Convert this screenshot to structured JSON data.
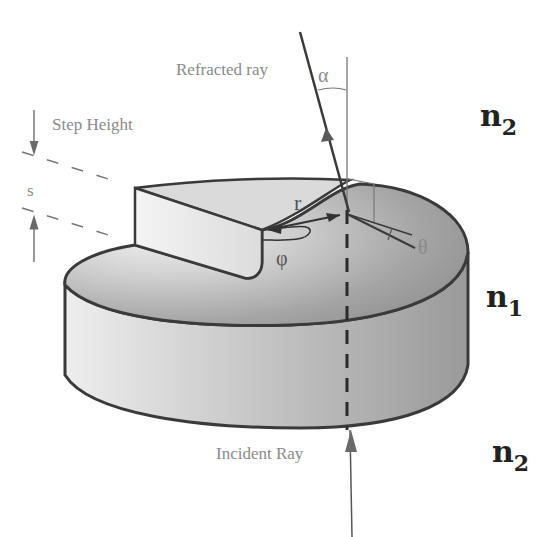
{
  "figure": {
    "type": "optics-diagram",
    "labels": {
      "refracted_ray": "Refracted ray",
      "incident_ray": "Incident Ray",
      "step_height": "Step Height",
      "step_symbol": "s",
      "alpha": "α",
      "theta": "θ",
      "phi": "φ",
      "r": "r",
      "n_top": "n",
      "n_top_sub": "2",
      "n_mid": "n",
      "n_mid_sub": "1",
      "n_bottom": "n",
      "n_bottom_sub": "2"
    },
    "colors": {
      "outline": "#3a3a3a",
      "disk_fill_light": "#e6e6e6",
      "disk_fill_dark": "#8f8f8f",
      "label_gray": "#8a8a8a",
      "label_dark": "#222222"
    }
  }
}
